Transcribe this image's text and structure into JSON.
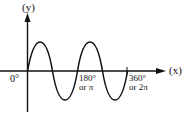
{
  "diagram": {
    "type": "sine-wave",
    "y_axis_label": "(y)",
    "x_axis_label": "(x)",
    "origin_label": "0°",
    "tick_180_line1": "180°",
    "tick_180_line2": "or π",
    "tick_360_line1": "360°",
    "tick_360_line2": "or 2π",
    "cycles_shown": 2,
    "stroke_color": "#111111"
  }
}
